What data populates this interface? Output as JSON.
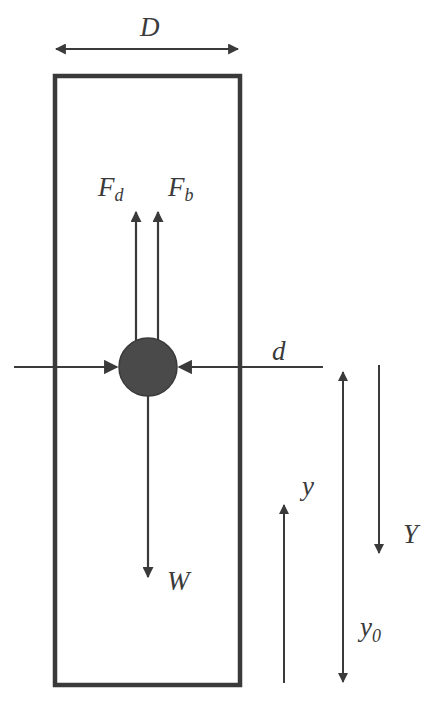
{
  "diagram": {
    "type": "free-body diagram of particle settling in a column",
    "colors": {
      "stroke": "#3a3a3a",
      "particle": "#4a4a4a",
      "background": "#ffffff"
    },
    "labels": {
      "column_diameter": "D",
      "drag_force": "F",
      "drag_force_sub": "d",
      "buoyancy_force": "F",
      "buoyancy_force_sub": "b",
      "particle_diameter": "d",
      "weight": "W",
      "height_coord": "y",
      "depth_coord": "Y",
      "initial_height": "y",
      "initial_height_sub": "0"
    },
    "elements": [
      {
        "id": "column",
        "kind": "rectangle"
      },
      {
        "id": "particle",
        "kind": "circle"
      },
      {
        "id": "D-dimension",
        "kind": "double-arrow",
        "direction": "horizontal"
      },
      {
        "id": "Fd-arrow",
        "kind": "arrow",
        "direction": "up"
      },
      {
        "id": "Fb-arrow",
        "kind": "arrow",
        "direction": "up"
      },
      {
        "id": "W-arrow",
        "kind": "arrow",
        "direction": "down"
      },
      {
        "id": "d-dimension",
        "kind": "inward-arrows",
        "direction": "horizontal"
      },
      {
        "id": "y-arrow",
        "kind": "arrow",
        "direction": "up"
      },
      {
        "id": "y0-dimension",
        "kind": "double-arrow",
        "direction": "vertical"
      },
      {
        "id": "Y-arrow",
        "kind": "arrow",
        "direction": "down"
      }
    ]
  }
}
